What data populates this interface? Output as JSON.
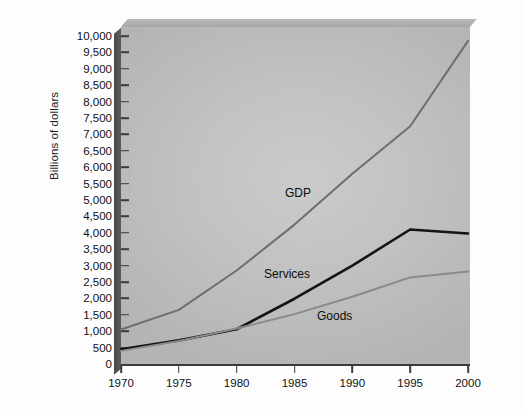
{
  "chart_data": {
    "type": "line",
    "title": "",
    "xlabel": "",
    "ylabel": "Billions of dollars",
    "x": [
      1970,
      1975,
      1980,
      1985,
      1990,
      1995,
      2000
    ],
    "xtick_labels": [
      "1970",
      "1975",
      "1980",
      "1985",
      "1990",
      "1995",
      "2000"
    ],
    "xlim": [
      1970,
      2000
    ],
    "ylim": [
      0,
      10000
    ],
    "ytick_labels": [
      "10,000",
      "9,500",
      "9,000",
      "8,500",
      "8,000",
      "7,500",
      "7,000",
      "6,500",
      "6,000",
      "5,500",
      "5,000",
      "4,500",
      "4,000",
      "3,500",
      "3,000",
      "2,500",
      "2,000",
      "1,500",
      "1,000",
      "500",
      "0"
    ],
    "ytick_values": [
      10000,
      9500,
      9000,
      8500,
      8000,
      7500,
      7000,
      6500,
      6000,
      5500,
      5000,
      4500,
      4000,
      3500,
      3000,
      2500,
      2000,
      1500,
      1000,
      500,
      0
    ],
    "grid": false,
    "legend_position": "inline-annotations",
    "series": [
      {
        "name": "GDP",
        "color": "#6e6e6e",
        "values": [
          1050,
          1650,
          2850,
          4250,
          5800,
          7250,
          9850
        ]
      },
      {
        "name": "Services",
        "color": "#141414",
        "values": [
          450,
          720,
          1060,
          1990,
          3000,
          4100,
          3980
        ]
      },
      {
        "name": "Goods",
        "color": "#8a8a8a",
        "values": [
          400,
          700,
          1080,
          1520,
          2050,
          2640,
          2820
        ]
      }
    ],
    "annotations": [
      {
        "text": "GDP",
        "series": "GDP"
      },
      {
        "text": "Services",
        "series": "Services"
      },
      {
        "text": "Goods",
        "series": "Goods"
      }
    ]
  }
}
